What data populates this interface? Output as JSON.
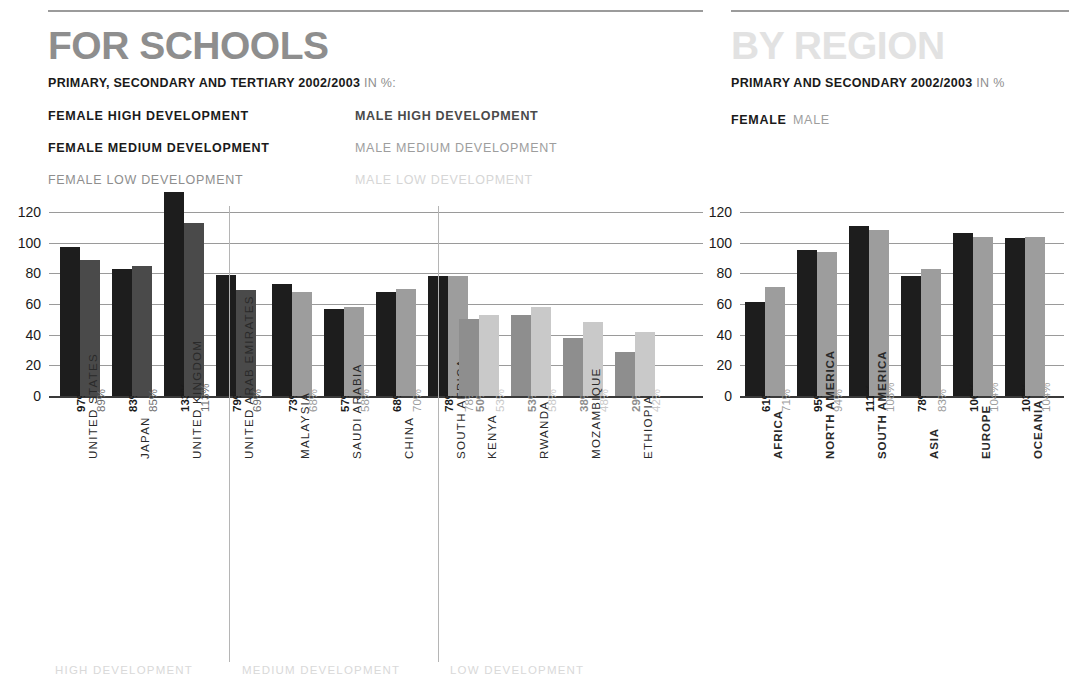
{
  "left_panel": {
    "title": "FOR SCHOOLS",
    "subtitle_bold": "PRIMARY, SECONDARY AND TERTIARY 2002/2003",
    "subtitle_light": "IN %:",
    "legend": [
      {
        "label": "FEMALE HIGH DEVELOPMENT",
        "color": "#1d1d1d"
      },
      {
        "label": "FEMALE MEDIUM DEVELOPMENT",
        "color": "#1d1d1d"
      },
      {
        "label": "FEMALE LOW DEVELOPMENT",
        "color": "#8e8e8e"
      },
      {
        "label": "MALE HIGH DEVELOPMENT",
        "color": "#4a4a4a"
      },
      {
        "label": "MALE MEDIUM DEVELOPMENT",
        "color": "#9d9d9d"
      },
      {
        "label": "MALE LOW DEVELOPMENT",
        "color": "#d6d6d6"
      }
    ],
    "group_labels": [
      "HIGH DEVELOPMENT",
      "MEDIUM DEVELOPMENT",
      "LOW DEVELOPMENT"
    ]
  },
  "right_panel": {
    "title": "BY REGION",
    "subtitle_bold": "PRIMARY AND SECONDARY 2002/2003",
    "subtitle_light": "IN %",
    "legend_female": "FEMALE",
    "legend_male": "MALE"
  },
  "chart_data": [
    {
      "type": "bar",
      "title": "FOR SCHOOLS",
      "subtitle": "PRIMARY, SECONDARY AND TERTIARY 2002/2003 IN %:",
      "xlabel": "",
      "ylabel": "",
      "ylim": [
        0,
        130
      ],
      "yticks": [
        0,
        20,
        40,
        60,
        80,
        100,
        120
      ],
      "grid": true,
      "legend_position": "top",
      "categories": [
        "UNITED STATES",
        "JAPAN",
        "UNITED KINGDOM",
        "UNITED ARAB EMIRATES",
        "MALAYSIA",
        "SAUDI ARABIA",
        "CHINA",
        "SOUTH AFRICA",
        "KENYA",
        "RWANDA",
        "MOZAMBIQUE",
        "ETHIOPIA"
      ],
      "groups": [
        {
          "name": "HIGH DEVELOPMENT",
          "categories": [
            "UNITED STATES",
            "JAPAN",
            "UNITED KINGDOM",
            "UNITED ARAB EMIRATES"
          ]
        },
        {
          "name": "MEDIUM DEVELOPMENT",
          "categories": [
            "MALAYSIA",
            "SAUDI ARABIA",
            "CHINA",
            "SOUTH AFRICA"
          ]
        },
        {
          "name": "LOW DEVELOPMENT",
          "categories": [
            "KENYA",
            "RWANDA",
            "MOZAMBIQUE",
            "ETHIOPIA"
          ]
        }
      ],
      "series": [
        {
          "name": "FEMALE",
          "values": [
            97,
            83,
            133,
            79,
            73,
            57,
            68,
            78,
            50,
            53,
            38,
            29
          ]
        },
        {
          "name": "MALE",
          "values": [
            89,
            85,
            113,
            69,
            68,
            58,
            70,
            78,
            53,
            58,
            48,
            42
          ]
        }
      ],
      "data_labels": {
        "female": [
          "97%",
          "83%",
          "133%",
          "79%",
          "73%",
          "57%",
          "68%",
          "78%",
          "50%",
          "53%",
          "38%",
          "29%"
        ],
        "male": [
          "89%",
          "85%",
          "113%",
          "69%",
          "68%",
          "58%",
          "70%",
          "78%",
          "53%",
          "58%",
          "48%",
          "42%"
        ]
      },
      "bar_colors": {
        "female_high": "#1d1d1d",
        "male_high": "#4a4a4a",
        "female_medium": "#1d1d1d",
        "male_medium": "#9d9d9d",
        "female_low": "#8e8e8e",
        "male_low": "#c9c9c9"
      }
    },
    {
      "type": "bar",
      "title": "BY REGION",
      "subtitle": "PRIMARY AND SECONDARY 2002/2003 IN %",
      "xlabel": "",
      "ylabel": "",
      "ylim": [
        0,
        130
      ],
      "yticks": [
        0,
        20,
        40,
        60,
        80,
        100,
        120
      ],
      "grid": true,
      "legend_position": "top",
      "categories": [
        "AFRICA",
        "NORTH AMERICA",
        "SOUTH AMERICA",
        "ASIA",
        "EUROPE",
        "OCEANIA"
      ],
      "series": [
        {
          "name": "FEMALE",
          "values": [
            61,
            95,
            111,
            78,
            106,
            103
          ]
        },
        {
          "name": "MALE",
          "values": [
            71,
            94,
            108,
            83,
            104,
            104
          ]
        }
      ],
      "data_labels": {
        "female": [
          "61%",
          "95%",
          "111%",
          "78%",
          "106%",
          "103%"
        ],
        "male": [
          "71%",
          "94%",
          "108%",
          "83%",
          "104%",
          "104%"
        ]
      },
      "bar_colors": {
        "female": "#1d1d1d",
        "male": "#9d9d9d"
      }
    }
  ]
}
